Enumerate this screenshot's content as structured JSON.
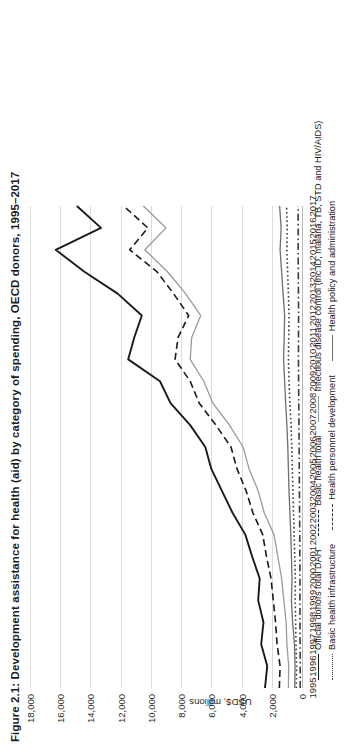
{
  "figure": {
    "title": "Figure 2.1: Development assistance for health (aid) by category of spending, OECD donors, 1995–2017"
  },
  "axes": {
    "ylabel": "USD$, millions",
    "yticks": [
      "0",
      "2,000",
      "4,000",
      "6,000",
      "8,000",
      "10,000",
      "12,000",
      "14,000",
      "16,000",
      "18,000"
    ],
    "xticks": [
      "1995",
      "1996",
      "1997",
      "1998",
      "1999",
      "2000",
      "2001",
      "2002",
      "2003",
      "2004",
      "2005",
      "2006",
      "2007",
      "2008",
      "2009",
      "2010",
      "2011",
      "2012",
      "2013",
      "2014",
      "2015",
      "2016",
      "2017"
    ]
  },
  "legend": {
    "items": [
      {
        "label": "Official donors total DAH",
        "color": "#1a1a1a",
        "dash": "solid",
        "width": 1.9
      },
      {
        "label": "Basic health total",
        "color": "#1a1a1a",
        "dash": "dash",
        "width": 1.6
      },
      {
        "label": "Infectious disease control (inc ID, malaria, TB, STD and HIV/AIDS)",
        "color": "#9a9a9a",
        "dash": "solid",
        "width": 1.4
      },
      {
        "label": "Basic health infrastructure",
        "color": "#3a3a3a",
        "dash": "dot",
        "width": 1.3
      },
      {
        "label": "Health personnel development",
        "color": "#3a3a3a",
        "dash": "dashdot",
        "width": 1.3
      },
      {
        "label": "Health policy and administration",
        "color": "#6e6e6e",
        "dash": "solid",
        "width": 1.2
      }
    ]
  },
  "chart_data": {
    "type": "line",
    "title": "Figure 2.1: Development assistance for health (aid) by category of spending, OECD donors, 1995–2017",
    "xlabel": "",
    "ylabel": "USD$, millions",
    "ylim": [
      0,
      18000
    ],
    "ytick_step": 2000,
    "grid": true,
    "legend_position": "bottom",
    "x": [
      1995,
      1996,
      1997,
      1998,
      1999,
      2000,
      2001,
      2002,
      2003,
      2004,
      2005,
      2006,
      2007,
      2008,
      2009,
      2010,
      2011,
      2012,
      2013,
      2014,
      2015,
      2016,
      2017
    ],
    "series": [
      {
        "name": "Official donors total DAH",
        "color": "#1a1a1a",
        "dash": "solid",
        "values": [
          2450,
          2300,
          2700,
          2550,
          2900,
          2800,
          3300,
          3750,
          4600,
          5300,
          6000,
          6400,
          7400,
          8700,
          9400,
          11500,
          11100,
          10600,
          12200,
          14400,
          16300,
          13300,
          14900
        ]
      },
      {
        "name": "Basic health total",
        "color": "#1a1a1a",
        "dash": "dash",
        "values": [
          1500,
          1450,
          1650,
          1750,
          1900,
          2050,
          2350,
          2600,
          3250,
          3700,
          4300,
          4700,
          5700,
          6800,
          7400,
          8400,
          8200,
          7500,
          8500,
          9600,
          11400,
          10200,
          11800
        ]
      },
      {
        "name": "Infectious disease control (inc ID, malaria, TB, STD and HIV/AIDS)",
        "color": "#9a9a9a",
        "dash": "solid",
        "values": [
          900,
          880,
          1000,
          1050,
          1200,
          1350,
          1600,
          1850,
          2500,
          2900,
          3500,
          3900,
          4800,
          5900,
          6500,
          7400,
          7300,
          6700,
          7700,
          8900,
          10400,
          9000,
          10500
        ]
      },
      {
        "name": "Basic health infrastructure",
        "color": "#3a3a3a",
        "dash": "dot",
        "values": [
          380,
          360,
          400,
          420,
          450,
          440,
          480,
          520,
          560,
          600,
          640,
          680,
          720,
          800,
          860,
          900,
          880,
          860,
          900,
          950,
          1000,
          980,
          1020
        ]
      },
      {
        "name": "Health personnel development",
        "color": "#3a3a3a",
        "dash": "dashdot",
        "values": [
          120,
          115,
          125,
          130,
          140,
          135,
          145,
          150,
          160,
          170,
          180,
          190,
          200,
          215,
          225,
          235,
          230,
          225,
          235,
          245,
          255,
          250,
          260
        ]
      },
      {
        "name": "Health policy and administration",
        "color": "#6e6e6e",
        "dash": "solid",
        "values": [
          480,
          460,
          500,
          620,
          700,
          660,
          700,
          740,
          800,
          860,
          900,
          940,
          1000,
          1080,
          1150,
          1220,
          1180,
          1150,
          1250,
          1350,
          1450,
          1380,
          1480
        ]
      }
    ]
  }
}
